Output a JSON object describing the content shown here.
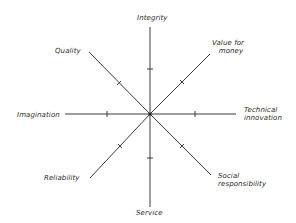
{
  "diagram": {
    "type": "radial-axes",
    "center": [
      150,
      114
    ],
    "axes": [
      {
        "id": "integrity",
        "label": "Integrity",
        "end": [
          150,
          27
        ],
        "tick": [
          150,
          69
        ]
      },
      {
        "id": "value-for-money",
        "label_lines": [
          "Value for",
          "money"
        ],
        "end": [
          210,
          54
        ],
        "tick": [
          182,
          82
        ]
      },
      {
        "id": "technical-innovation",
        "label_lines": [
          "Technical",
          "innovation"
        ],
        "end": [
          236,
          114
        ],
        "tick": [
          195,
          114
        ]
      },
      {
        "id": "social-responsibility",
        "label_lines": [
          "Social",
          "responsibility"
        ],
        "end": [
          211,
          175
        ],
        "tick": [
          182,
          146
        ]
      },
      {
        "id": "service",
        "label": "Service",
        "end": [
          150,
          207
        ],
        "tick": [
          150,
          158
        ]
      },
      {
        "id": "reliability",
        "label": "Reliability",
        "end": [
          90,
          178
        ],
        "tick": [
          120,
          146
        ]
      },
      {
        "id": "imagination",
        "label": "Imagination",
        "end": [
          65,
          114
        ],
        "tick": [
          107,
          114
        ]
      },
      {
        "id": "quality",
        "label": "Quality",
        "end": [
          89,
          52
        ],
        "tick": [
          119,
          83
        ]
      }
    ]
  },
  "labels": {
    "integrity": "Integrity",
    "value_for_money_1": "Value for",
    "value_for_money_2": "money",
    "technical_innovation_1": "Technical",
    "technical_innovation_2": "innovation",
    "social_responsibility_1": "Social",
    "social_responsibility_2": "responsibility",
    "service": "Service",
    "reliability": "Reliability",
    "imagination": "Imagination",
    "quality": "Quality"
  },
  "colors": {
    "line": "#3a3a3a",
    "text": "#2a2a2a",
    "background": "#ffffff"
  }
}
